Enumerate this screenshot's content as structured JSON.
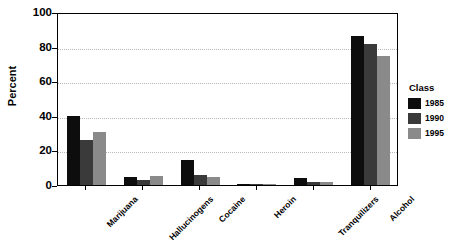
{
  "chart_data": {
    "type": "bar",
    "title": "",
    "subtitle": "",
    "xlabel": "",
    "ylabel": "Percent",
    "ylim": [
      0,
      100
    ],
    "yticks": [
      0,
      20,
      40,
      60,
      80,
      100
    ],
    "ytick_labels": [
      "0",
      "20",
      "40",
      "60",
      "80",
      "100"
    ],
    "grid": "horizontal-dotted",
    "legend_position": "right",
    "legend_title": "Class",
    "categories": [
      "Marijuana",
      "Hallucinogens",
      "Cocaine",
      "Heroin",
      "Tranquilizers",
      "Alcohol"
    ],
    "series": [
      {
        "name": "1985",
        "color": "#0d0d0d",
        "values": [
          40,
          4.5,
          14.5,
          0.5,
          4,
          86
        ]
      },
      {
        "name": "1990",
        "color": "#3a3a3a",
        "values": [
          26,
          3,
          6,
          0.5,
          2,
          81.5
        ]
      },
      {
        "name": "1995",
        "color": "#8a8a8a",
        "values": [
          30.5,
          5,
          4.5,
          0.5,
          2,
          74.5
        ]
      }
    ]
  },
  "axes": {
    "y_title": "Percent"
  },
  "legend": {
    "title": "Class",
    "entries": [
      {
        "label": "1985",
        "color": "#0d0d0d"
      },
      {
        "label": "1990",
        "color": "#3a3a3a"
      },
      {
        "label": "1995",
        "color": "#8a8a8a"
      }
    ]
  }
}
